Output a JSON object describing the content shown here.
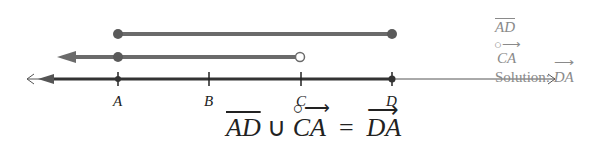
{
  "diagram": {
    "points": [
      {
        "label": "A",
        "x": 118
      },
      {
        "label": "B",
        "x": 209
      },
      {
        "label": "C",
        "x": 301
      },
      {
        "label": "D",
        "x": 392
      }
    ],
    "segment_AD": {
      "label": "AD",
      "from": "A",
      "to": "D",
      "endpoints": "closed-closed",
      "color": "#5a5a5a"
    },
    "ray_CA": {
      "label": "CA",
      "from": "C",
      "direction": "left",
      "endpoint_C": "open",
      "includes_A_marker": true,
      "color": "#5a5a5a"
    },
    "solution_ray_DA": {
      "label": "DA",
      "from": "D",
      "direction": "left",
      "color": "#333333"
    },
    "legend": {
      "item1": "AD",
      "item2": "CA",
      "solution_prefix": "Solution: ",
      "solution_value": "DA"
    },
    "equation": {
      "left1": "AD",
      "op1": "∪",
      "left2": "CA",
      "op2": "=",
      "right": "DA"
    }
  }
}
